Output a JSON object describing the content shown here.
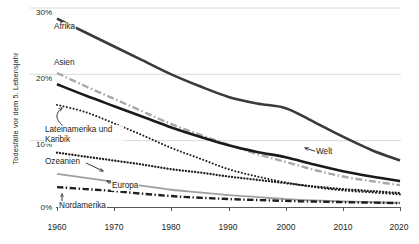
{
  "chart_data": {
    "type": "line",
    "title": "",
    "xlabel": "",
    "ylabel": "Todesfälle vor dem 5. Lebensjahr",
    "xlim": [
      1960,
      2020
    ],
    "ylim": [
      0,
      30
    ],
    "ytick_labels": [
      "30%",
      "20%",
      "10%",
      "0%"
    ],
    "ytick_values": [
      30,
      20,
      10,
      0
    ],
    "xtick_labels": [
      "1960",
      "1970",
      "1980",
      "1990",
      "2000",
      "2010",
      "2020"
    ],
    "xtick_values": [
      1960,
      1970,
      1980,
      1990,
      2000,
      2010,
      2020
    ],
    "grid": "horizontal",
    "legend_position": "inline-labels",
    "x": [
      1960,
      1965,
      1970,
      1975,
      1980,
      1985,
      1990,
      1995,
      2000,
      2005,
      2010,
      2015,
      2020
    ],
    "series": [
      {
        "name": "Afrika",
        "style": "solid",
        "color": "#3a3a3c",
        "width": 2.6,
        "values": [
          28.4,
          26.3,
          24.2,
          22.1,
          20.0,
          18.2,
          16.6,
          15.6,
          14.9,
          12.8,
          10.6,
          8.6,
          7.0
        ]
      },
      {
        "name": "Asien",
        "style": "dash-dot",
        "color": "#a7a9ac",
        "width": 2.4,
        "values": [
          20.2,
          18.2,
          16.3,
          14.4,
          12.5,
          10.9,
          9.4,
          8.0,
          6.8,
          5.6,
          4.6,
          3.9,
          3.3
        ]
      },
      {
        "name": "Welt",
        "style": "solid",
        "color": "#1a1a1a",
        "width": 2.6,
        "values": [
          18.5,
          16.8,
          15.2,
          13.6,
          12.0,
          10.6,
          9.3,
          8.3,
          7.5,
          6.4,
          5.4,
          4.6,
          3.9
        ]
      },
      {
        "name": "Lateinamerika und Karibik",
        "style": "dotted-fine",
        "color": "#231f20",
        "width": 2.0,
        "values": [
          15.4,
          14.3,
          12.6,
          10.8,
          8.9,
          7.3,
          5.7,
          4.6,
          3.7,
          3.0,
          2.5,
          2.2,
          1.9
        ]
      },
      {
        "name": "Ozeanien",
        "style": "dotted-bold",
        "color": "#231f20",
        "width": 2.3,
        "values": [
          8.2,
          7.6,
          7.0,
          6.4,
          5.7,
          5.2,
          4.6,
          4.1,
          3.6,
          3.1,
          2.7,
          2.4,
          2.1
        ]
      },
      {
        "name": "Europa",
        "style": "solid-thin",
        "color": "#9d9fa2",
        "width": 1.8,
        "values": [
          5.0,
          4.4,
          3.8,
          3.2,
          2.6,
          2.2,
          1.8,
          1.5,
          1.2,
          1.0,
          0.85,
          0.72,
          0.62
        ]
      },
      {
        "name": "Nordamerika",
        "style": "dash-dot-bold",
        "color": "#231f20",
        "width": 2.4,
        "values": [
          3.0,
          2.7,
          2.4,
          2.0,
          1.65,
          1.4,
          1.2,
          1.05,
          0.92,
          0.82,
          0.73,
          0.66,
          0.6
        ]
      }
    ],
    "annotations": [
      {
        "text": "Afrika",
        "series": "Afrika"
      },
      {
        "text": "Asien",
        "series": "Asien"
      },
      {
        "text": "Welt",
        "series": "Welt",
        "leader": "arrow"
      },
      {
        "text": "Lateinamerika und Karibik",
        "series": "Lateinamerika und Karibik",
        "leader": "curved-arrow"
      },
      {
        "text": "Ozeanien",
        "series": "Ozeanien",
        "leader": "curved-arrow"
      },
      {
        "text": "Europa",
        "series": "Europa",
        "leader": "arrow"
      },
      {
        "text": "Nordamerika",
        "series": "Nordamerika",
        "leader": "arrow"
      }
    ]
  }
}
